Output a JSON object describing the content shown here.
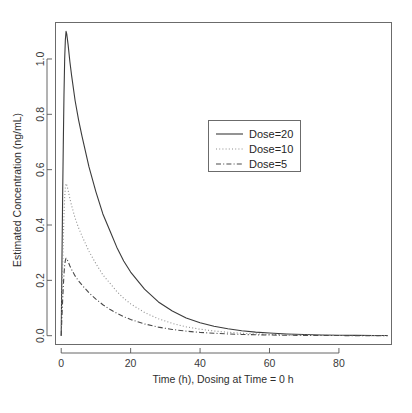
{
  "chart_data": {
    "type": "line",
    "title": "",
    "xlabel": "Time (h), Dosing at Time = 0 h",
    "ylabel": "Estimated Concentration (ng/mL)",
    "xlim": [
      -1.5,
      95
    ],
    "ylim": [
      -0.03,
      1.13
    ],
    "grid": false,
    "legend_position": "upper-center-right",
    "x_ticks": [
      0,
      20,
      40,
      60,
      80
    ],
    "x_tick_labels": [
      "0",
      "20",
      "40",
      "60",
      "80"
    ],
    "y_ticks": [
      0.0,
      0.2,
      0.4,
      0.6,
      0.8,
      1.0
    ],
    "y_tick_labels": [
      "0.0",
      "0.2",
      "0.4",
      "0.6",
      "0.8",
      "1.0"
    ],
    "series": [
      {
        "name": "Dose=20",
        "style": "solid",
        "color": "#3b3b3b",
        "peak_time": 1.4,
        "peak_value": 1.1,
        "x": [
          0,
          0.2,
          0.4,
          0.6,
          0.8,
          1.0,
          1.2,
          1.4,
          1.6,
          2,
          2.5,
          3,
          4,
          5,
          6,
          8,
          10,
          12,
          14,
          16,
          18,
          20,
          24,
          28,
          32,
          36,
          40,
          44,
          48,
          52,
          56,
          60,
          65,
          70,
          75,
          80,
          85,
          90,
          94
        ],
        "y": [
          0.0,
          0.25,
          0.49,
          0.69,
          0.87,
          1.0,
          1.07,
          1.1,
          1.09,
          1.05,
          0.99,
          0.94,
          0.85,
          0.78,
          0.72,
          0.61,
          0.52,
          0.44,
          0.38,
          0.32,
          0.27,
          0.23,
          0.168,
          0.122,
          0.089,
          0.064,
          0.047,
          0.034,
          0.025,
          0.018,
          0.013,
          0.0095,
          0.0062,
          0.0041,
          0.0027,
          0.0018,
          0.0012,
          0.0008,
          0.0006
        ]
      },
      {
        "name": "Dose=10",
        "style": "dotted",
        "color": "#8e8e8e",
        "peak_time": 1.4,
        "peak_value": 0.55,
        "x": [
          0,
          0.2,
          0.4,
          0.6,
          0.8,
          1.0,
          1.2,
          1.4,
          1.6,
          2,
          2.5,
          3,
          4,
          5,
          6,
          8,
          10,
          12,
          14,
          16,
          18,
          20,
          24,
          28,
          32,
          36,
          40,
          44,
          48,
          52,
          56,
          60,
          65,
          70,
          75,
          80,
          85,
          90,
          94
        ],
        "y": [
          0.0,
          0.125,
          0.245,
          0.345,
          0.435,
          0.5,
          0.535,
          0.55,
          0.545,
          0.525,
          0.495,
          0.47,
          0.425,
          0.39,
          0.36,
          0.305,
          0.26,
          0.22,
          0.19,
          0.16,
          0.135,
          0.115,
          0.084,
          0.061,
          0.0445,
          0.032,
          0.0235,
          0.017,
          0.0125,
          0.009,
          0.0065,
          0.0048,
          0.0031,
          0.0021,
          0.0014,
          0.0009,
          0.0006,
          0.0004,
          0.0003
        ]
      },
      {
        "name": "Dose=5",
        "style": "dashdot",
        "color": "#4a4a4a",
        "peak_time": 1.4,
        "peak_value": 0.28,
        "x": [
          0,
          0.2,
          0.4,
          0.6,
          0.8,
          1.0,
          1.2,
          1.4,
          1.6,
          2,
          2.5,
          3,
          4,
          5,
          6,
          8,
          10,
          12,
          14,
          16,
          18,
          20,
          24,
          28,
          32,
          36,
          40,
          44,
          48,
          52,
          56,
          60,
          65,
          70,
          75,
          80,
          85,
          90,
          94
        ],
        "y": [
          0.0,
          0.064,
          0.125,
          0.176,
          0.222,
          0.255,
          0.272,
          0.28,
          0.278,
          0.268,
          0.252,
          0.239,
          0.216,
          0.198,
          0.183,
          0.155,
          0.132,
          0.112,
          0.0955,
          0.081,
          0.0688,
          0.0585,
          0.0425,
          0.031,
          0.0226,
          0.0164,
          0.0119,
          0.0087,
          0.0063,
          0.0046,
          0.0033,
          0.0024,
          0.0016,
          0.0011,
          0.0007,
          0.0005,
          0.0003,
          0.0002,
          0.0002
        ]
      }
    ]
  },
  "legend": {
    "entries": [
      {
        "label": "Dose=20"
      },
      {
        "label": "Dose=10"
      },
      {
        "label": "Dose=5"
      }
    ]
  },
  "axes": {
    "x_title": "Time (h), Dosing at Time = 0 h",
    "y_title": "Estimated Concentration (ng/mL)"
  }
}
